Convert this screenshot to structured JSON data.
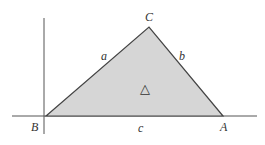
{
  "diagram": {
    "vertices": {
      "C": "C",
      "B": "B",
      "A": "A"
    },
    "sides": {
      "a": "a",
      "b": "b",
      "c": "c"
    },
    "area_symbol": "△",
    "colors": {
      "fill": "#d6d6d6",
      "stroke": "#444444",
      "axis": "#555555"
    }
  }
}
